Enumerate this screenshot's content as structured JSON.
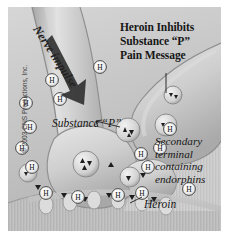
{
  "figure": {
    "title_lines": [
      "Heroin Inhibits",
      "Substance “P”",
      "Pain Message"
    ],
    "title_text": "Heroin Inhibits Substance “P” Pain Message",
    "copyright": "© 2003 CNS Productions, Inc.",
    "background_color": "#c9c9c9",
    "ink_color": "#171717",
    "border_color": "#ffffff"
  },
  "labels": {
    "nerve_impulse": "Nerve impulse",
    "substance_p": "Substance “P”",
    "secondary_terminal_lines": [
      "Secondary",
      "terminal",
      "containing",
      "endorphins"
    ],
    "secondary_terminal_text": "Secondary terminal containing endorphins",
    "heroin": "Heroin"
  },
  "diagram": {
    "molecule_label": "H",
    "molecule_name": "heroin-molecule",
    "vesicle_name": "substance-p-vesicle",
    "heroin_molecules_count": 14,
    "substance_p_vesicles_count": 5,
    "receptor_count": 6,
    "arrow_direction": "down-right"
  }
}
